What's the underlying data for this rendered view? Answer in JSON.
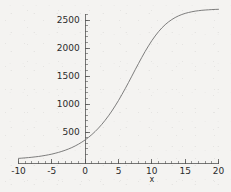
{
  "chart_data": {
    "type": "line",
    "title": "",
    "subtitle": "",
    "xlabel": "x",
    "ylabel": "",
    "xlim": [
      -10,
      20
    ],
    "ylim": [
      0,
      2640
    ],
    "grid": false,
    "legend": null,
    "x_ticks": [
      {
        "value": -10,
        "label": "-10"
      },
      {
        "value": -5,
        "label": "-5"
      },
      {
        "value": 0,
        "label": "0"
      },
      {
        "value": 5,
        "label": "5"
      },
      {
        "value": 10,
        "label": "10"
      },
      {
        "value": 15,
        "label": "15"
      },
      {
        "value": 20,
        "label": "20"
      }
    ],
    "y_ticks": [
      {
        "value": 500,
        "label": "500"
      },
      {
        "value": 1000,
        "label": "1000"
      },
      {
        "value": 1500,
        "label": "1500"
      },
      {
        "value": 2000,
        "label": "2000"
      },
      {
        "value": 2500,
        "label": "2500"
      }
    ],
    "x_minor_interval": 1,
    "y_minor_interval": 100,
    "series": [
      {
        "name": "logistic",
        "color": "#6f6f6f",
        "x": [
          -10,
          -9.5,
          -9,
          -8.5,
          -8,
          -7.5,
          -7,
          -6.5,
          -6,
          -5.5,
          -5,
          -4.5,
          -4,
          -3.5,
          -3,
          -2.5,
          -2,
          -1.5,
          -1,
          -0.5,
          0,
          0.5,
          1,
          1.5,
          2,
          2.5,
          3,
          3.5,
          4,
          4.5,
          5,
          5.5,
          6,
          6.5,
          7,
          7.5,
          8,
          8.5,
          9,
          9.5,
          10,
          10.5,
          11,
          11.5,
          12,
          12.5,
          13,
          13.5,
          14,
          14.5,
          15,
          15.5,
          16,
          16.5,
          17,
          17.5,
          18,
          18.5,
          19,
          19.5,
          20
        ],
        "y": [
          29,
          33,
          38,
          43,
          49,
          56,
          63,
          72,
          82,
          93,
          105,
          120,
          136,
          154,
          174,
          197,
          222,
          251,
          283,
          319,
          359,
          404,
          454,
          509,
          570,
          637,
          710,
          789,
          874,
          966,
          1063,
          1166,
          1273,
          1384,
          1497,
          1611,
          1723,
          1833,
          1939,
          2038,
          2131,
          2215,
          2291,
          2358,
          2416,
          2466,
          2508,
          2544,
          2574,
          2598,
          2618,
          2634,
          2647,
          2658,
          2666,
          2673,
          2678,
          2682,
          2686,
          2689,
          2691
        ]
      }
    ]
  },
  "axis": {
    "x_axis_name": "x-axis",
    "y_axis_name": "y-axis"
  }
}
